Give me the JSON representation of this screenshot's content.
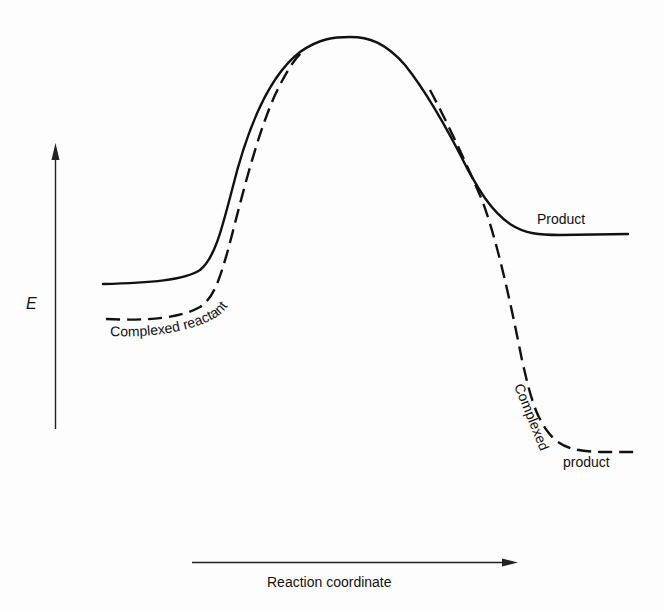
{
  "diagram": {
    "type": "reaction-energy-profile",
    "y_axis": {
      "label": "E",
      "direction": "up"
    },
    "x_axis": {
      "label": "Reaction coordinate",
      "direction": "right"
    },
    "curves": [
      {
        "id": "uncomplexed",
        "style": "solid",
        "start_label": "",
        "end_label": "Product"
      },
      {
        "id": "complexed",
        "style": "dashed",
        "start_label": "Complexed reactant",
        "end_label": "Complexed product"
      }
    ],
    "labels": {
      "product": "Product",
      "complexed_reactant": "Complexed reactant",
      "complexed_word": "Complexed",
      "product_word": "product"
    },
    "colors": {
      "background": "#fdfdfd",
      "ink": "#111111"
    }
  }
}
